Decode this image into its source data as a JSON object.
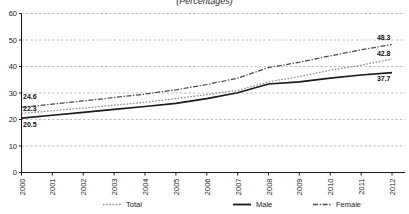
{
  "chart_data": {
    "type": "line",
    "title": "(Percentages)",
    "xlabel": "",
    "ylabel": "",
    "ylim": [
      0,
      60
    ],
    "ytick_values": [
      0,
      10,
      20,
      30,
      40,
      50,
      60
    ],
    "ytick_labels": [
      "0",
      "10",
      "20",
      "30",
      "40",
      "50",
      "60"
    ],
    "grid": true,
    "grid_style": "dashed-horizontal",
    "legend_position": "bottom",
    "categories": [
      "2000",
      "2001",
      "2002",
      "2003",
      "2004",
      "2005",
      "2006",
      "2007",
      "2008",
      "2009",
      "2010",
      "2011",
      "2012"
    ],
    "series": [
      {
        "name": "Total",
        "style": "dotted",
        "color": "#8c8c8c",
        "values": [
          22.3,
          23.3,
          24.3,
          25.4,
          26.5,
          27.9,
          29.4,
          31.0,
          34.2,
          36.2,
          38.6,
          40.5,
          42.8
        ],
        "label_start": "22.3",
        "label_end": "42.8"
      },
      {
        "name": "Male",
        "style": "solid",
        "color": "#1a1a1a",
        "values": [
          20.5,
          21.6,
          22.7,
          23.8,
          24.9,
          26.1,
          27.9,
          30.1,
          33.4,
          34.2,
          35.6,
          36.8,
          37.7
        ],
        "label_start": "20.5",
        "label_end": "37.7"
      },
      {
        "name": "Female",
        "style": "dash-dot",
        "color": "#4a4a4a",
        "values": [
          24.6,
          25.8,
          27.0,
          28.3,
          29.6,
          31.2,
          33.2,
          35.6,
          39.6,
          41.6,
          44.0,
          46.3,
          48.3
        ],
        "label_start": "24.6",
        "label_end": "48.3"
      }
    ],
    "annotations": [
      {
        "text": "24.6",
        "series": "Female",
        "side": "left"
      },
      {
        "text": "22.3",
        "series": "Total",
        "side": "left"
      },
      {
        "text": "20.5",
        "series": "Male",
        "side": "left"
      },
      {
        "text": "48.3",
        "series": "Female",
        "side": "right"
      },
      {
        "text": "42.8",
        "series": "Total",
        "side": "right"
      },
      {
        "text": "37.7",
        "series": "Male",
        "side": "right"
      }
    ]
  },
  "legend": {
    "items": [
      {
        "label": "Total",
        "style": "dotted"
      },
      {
        "label": "Male",
        "style": "solid"
      },
      {
        "label": "Female",
        "style": "dash-dot"
      }
    ]
  },
  "colors": {
    "axis": "#1a1a1a",
    "grid": "#a9a9a9",
    "total": "#8c8c8c",
    "male": "#1a1a1a",
    "female": "#4a4a4a",
    "background": "#ffffff"
  }
}
